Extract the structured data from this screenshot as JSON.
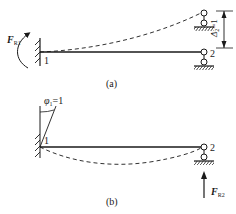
{
  "figure": {
    "panels": [
      {
        "id": "a",
        "caption": "(a)",
        "node_labels": {
          "fixed_end": "1",
          "roller_end": "2"
        },
        "reaction_label": {
          "symbol": "F",
          "subscript": "R1"
        },
        "displacement_label": {
          "symbol": "Δ",
          "subscript": "2",
          "value": "=1"
        },
        "description": "Fixed-end beam with roller at node 2; node 2 displaced upward by unit displacement, dashed deflected shape, reaction moment F_R1 at fixed end"
      },
      {
        "id": "b",
        "caption": "(b)",
        "node_labels": {
          "fixed_end": "1",
          "roller_end": "2"
        },
        "rotation_label": {
          "symbol": "φ",
          "subscript": "1",
          "value": "=1"
        },
        "reaction_label": {
          "symbol": "F",
          "subscript": "R2"
        },
        "description": "Fixed end rotated by unit rotation φ1=1, dashed deflected shape sagging, upward reaction F_R2 at roller support 2"
      }
    ]
  }
}
